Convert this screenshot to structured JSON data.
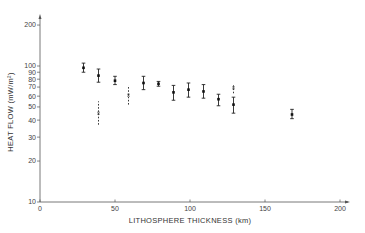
{
  "chart_data": {
    "type": "scatter",
    "title": "",
    "xlabel": "LITHOSPHERE THICKNESS (km)",
    "ylabel": "HEAT FLOW (mW/m²)",
    "xlim": [
      0,
      200
    ],
    "ylim": [
      10,
      200
    ],
    "yscale": "log",
    "grid": false,
    "x_ticks": [
      0,
      50,
      100,
      150,
      200
    ],
    "y_ticks": [
      10,
      20,
      30,
      40,
      50,
      60,
      70,
      80,
      90,
      100,
      200
    ],
    "y_tick_labels": [
      "10",
      "20",
      "30",
      "40",
      "50",
      "60",
      "70",
      "80",
      "90",
      "100",
      "200"
    ],
    "series": [
      {
        "name": "measured (solid error bars)",
        "style": "solid",
        "points": [
          {
            "x": 29,
            "y": 97,
            "ylow": 90,
            "yhigh": 105
          },
          {
            "x": 39,
            "y": 85,
            "ylow": 76,
            "yhigh": 95
          },
          {
            "x": 50,
            "y": 78,
            "ylow": 73,
            "yhigh": 84
          },
          {
            "x": 69,
            "y": 75,
            "ylow": 67,
            "yhigh": 84
          },
          {
            "x": 79,
            "y": 74,
            "ylow": 71,
            "yhigh": 77
          },
          {
            "x": 89,
            "y": 64,
            "ylow": 56,
            "yhigh": 72
          },
          {
            "x": 99,
            "y": 67,
            "ylow": 59,
            "yhigh": 75
          },
          {
            "x": 109,
            "y": 65,
            "ylow": 58,
            "yhigh": 73
          },
          {
            "x": 119,
            "y": 57,
            "ylow": 51,
            "yhigh": 62
          },
          {
            "x": 129,
            "y": 52,
            "ylow": 45,
            "yhigh": 59
          },
          {
            "x": 168,
            "y": 44,
            "ylow": 41,
            "yhigh": 48
          }
        ]
      },
      {
        "name": "alternative estimate (dashed error bars)",
        "style": "dashed",
        "points": [
          {
            "x": 39,
            "y": 45,
            "ylow": 37,
            "yhigh": 55
          },
          {
            "x": 59,
            "y": 61,
            "ylow": 52,
            "yhigh": 72
          },
          {
            "x": 129,
            "y": 69,
            "ylow": 63,
            "yhigh": 74
          }
        ]
      }
    ]
  }
}
